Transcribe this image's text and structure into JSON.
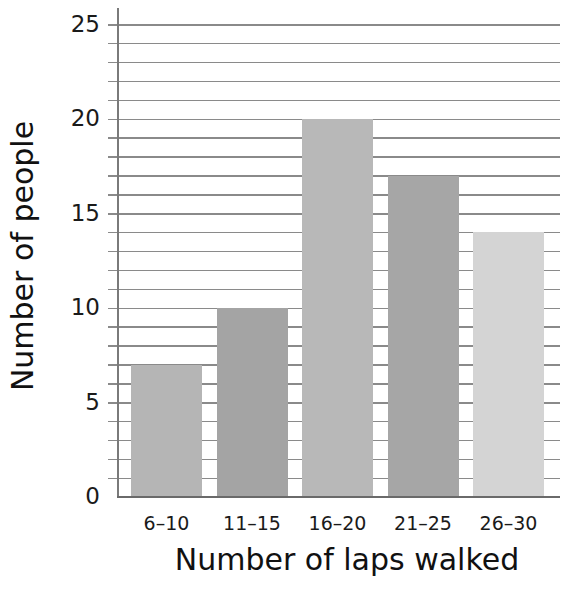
{
  "chart_data": {
    "type": "bar",
    "title": "",
    "xlabel": "Number of laps walked",
    "ylabel": "Number of people",
    "categories": [
      "6–10",
      "11–15",
      "16–20",
      "21–25",
      "26–30"
    ],
    "values": [
      7,
      10,
      20,
      17,
      14
    ],
    "ylim": [
      0,
      25
    ],
    "yticks": [
      0,
      5,
      10,
      15,
      20,
      25
    ],
    "grid": true,
    "grid_step": 1,
    "legend": null,
    "colors": [
      "#b5b5b5",
      "#a4a4a4",
      "#b8b8b8",
      "#a6a6a6",
      "#d4d4d4"
    ]
  },
  "labels": {
    "xlabel": "Number of laps walked",
    "ylabel": "Number of people",
    "ytick_labels": [
      "0",
      "5",
      "10",
      "15",
      "20",
      "25"
    ],
    "xtick_labels": [
      "6–10",
      "11–15",
      "16–20",
      "21–25",
      "26–30"
    ]
  }
}
